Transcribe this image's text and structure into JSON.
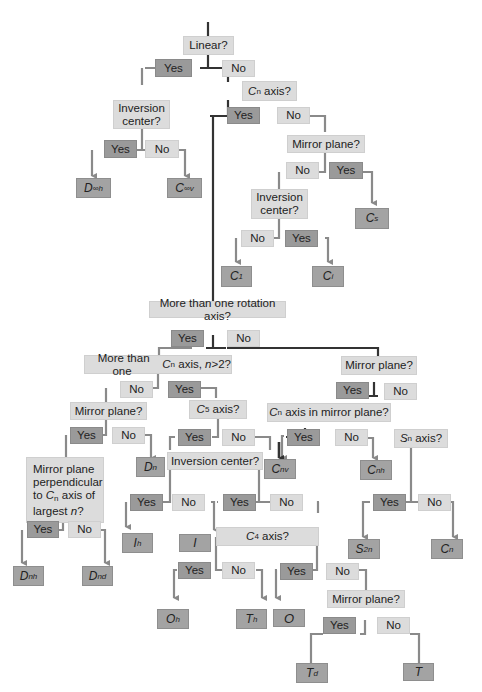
{
  "diagram": {
    "colors": {
      "question": "#dcdcdc",
      "yes": "#9a9a9a",
      "no": "#dcdcdc",
      "result": "#a3a3a3",
      "main_line": "#333333",
      "branch_line": "#8a8a8a"
    },
    "nodes": {
      "linear": "Linear?",
      "yes1": "Yes",
      "no1": "No",
      "inv1": "Inversion center?",
      "yes2": "Yes",
      "no2": "No",
      "dinfh": "D∞h",
      "cinfv": "C∞v",
      "cn_axis": "Cn axis?",
      "yes3": "Yes",
      "no3": "No",
      "mirror1": "Mirror plane?",
      "no4": "No",
      "yes4": "Yes",
      "cs": "Cs",
      "inv2": "Inversion center?",
      "no5": "No",
      "yes5": "Yes",
      "c1": "C1",
      "ci": "Ci",
      "more_rot": "More than one rotation axis?",
      "yes6": "Yes",
      "no6": "No",
      "more_cn": "More than one Cn axis, n>2?",
      "no7": "No",
      "yes7": "Yes",
      "mirror2": "Mirror plane?",
      "yes8": "Yes",
      "no8": "No",
      "dn": "Dn",
      "perp": "Mirror plane perpendicular to Cn axis of largest n?",
      "yes9": "Yes",
      "no9": "No",
      "dnh": "Dnh",
      "dnd": "Dnd",
      "c5": "C5 axis?",
      "yes10": "Yes",
      "no10": "No",
      "inv3": "Inversion center?",
      "yes11": "Yes",
      "no11": "No",
      "ih": "Ih",
      "i": "I",
      "yes12": "Yes",
      "no12": "No",
      "c4": "C4 axis?",
      "yes13": "Yes",
      "no13": "No",
      "oh": "Oh",
      "th": "Th",
      "yes14": "Yes",
      "no14": "No",
      "o": "O",
      "mirror4": "Mirror plane?",
      "yes15": "Yes",
      "no15": "No",
      "td": "Td",
      "t": "T",
      "mirror3": "Mirror plane?",
      "yes16": "Yes",
      "no16": "No",
      "cn_in_mirror": "Cn axis in mirror plane?",
      "yes17": "Yes",
      "no17": "No",
      "cnv": "Cnv",
      "cnh": "Cnh",
      "sn": "Sn axis?",
      "yes18": "Yes",
      "no18": "No",
      "s2n": "S2n",
      "cn": "Cn"
    }
  }
}
